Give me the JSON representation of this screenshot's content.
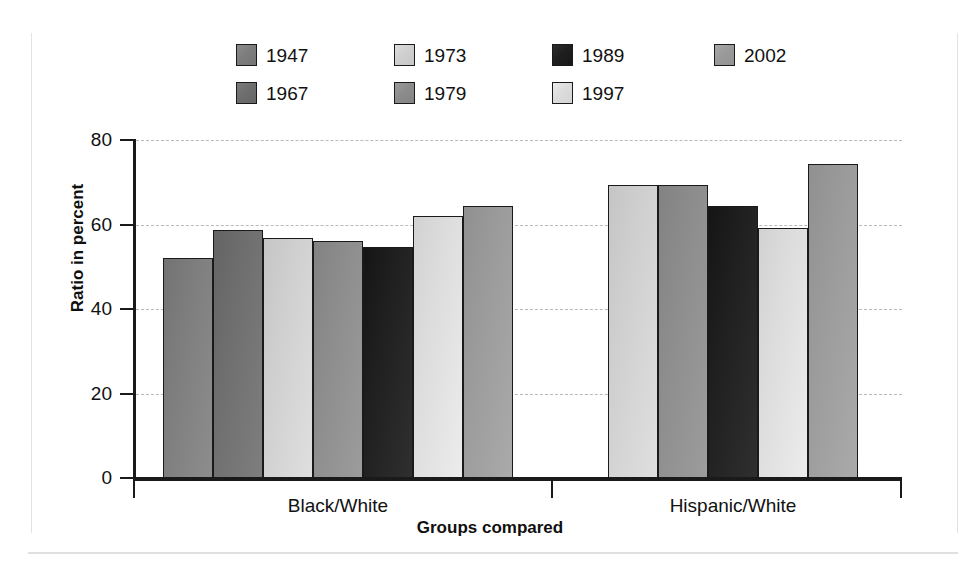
{
  "chart_data": {
    "type": "bar",
    "title": "",
    "subtitle": "",
    "xlabel": "Groups compared",
    "ylabel": "Ratio in percent",
    "categories": [
      "Black/White",
      "Hispanic/White"
    ],
    "ylim": [
      0,
      80
    ],
    "yticks": [
      0,
      20,
      40,
      60,
      80
    ],
    "ytick_labels": [
      "0",
      "20",
      "40",
      "60",
      "80"
    ],
    "grid": true,
    "legend_position": "top",
    "series": [
      {
        "name": "1947",
        "color": "#7d7d7d",
        "values": [
          52.0,
          null
        ]
      },
      {
        "name": "1967",
        "color": "#6e6e6e",
        "values": [
          58.7,
          null
        ]
      },
      {
        "name": "1973",
        "color": "#cfcfcf",
        "values": [
          56.7,
          69.4
        ]
      },
      {
        "name": "1979",
        "color": "#8c8c8c",
        "values": [
          56.0,
          69.4
        ]
      },
      {
        "name": "1989",
        "color": "#1f1f1f",
        "values": [
          54.6,
          64.3
        ]
      },
      {
        "name": "1997",
        "color": "#dcdcdc",
        "values": [
          62.0,
          59.2
        ]
      },
      {
        "name": "2002",
        "color": "#9a9a9a",
        "values": [
          64.3,
          74.3
        ]
      }
    ]
  },
  "legend": {
    "rows": [
      [
        {
          "label": "1947",
          "color": "#7d7d7d"
        },
        {
          "label": "1973",
          "color": "#cfcfcf"
        },
        {
          "label": "1989",
          "color": "#1f1f1f"
        },
        {
          "label": "2002",
          "color": "#9a9a9a"
        }
      ],
      [
        {
          "label": "1967",
          "color": "#6e6e6e"
        },
        {
          "label": "1979",
          "color": "#8c8c8c"
        },
        {
          "label": "1997",
          "color": "#dcdcdc"
        }
      ]
    ]
  }
}
